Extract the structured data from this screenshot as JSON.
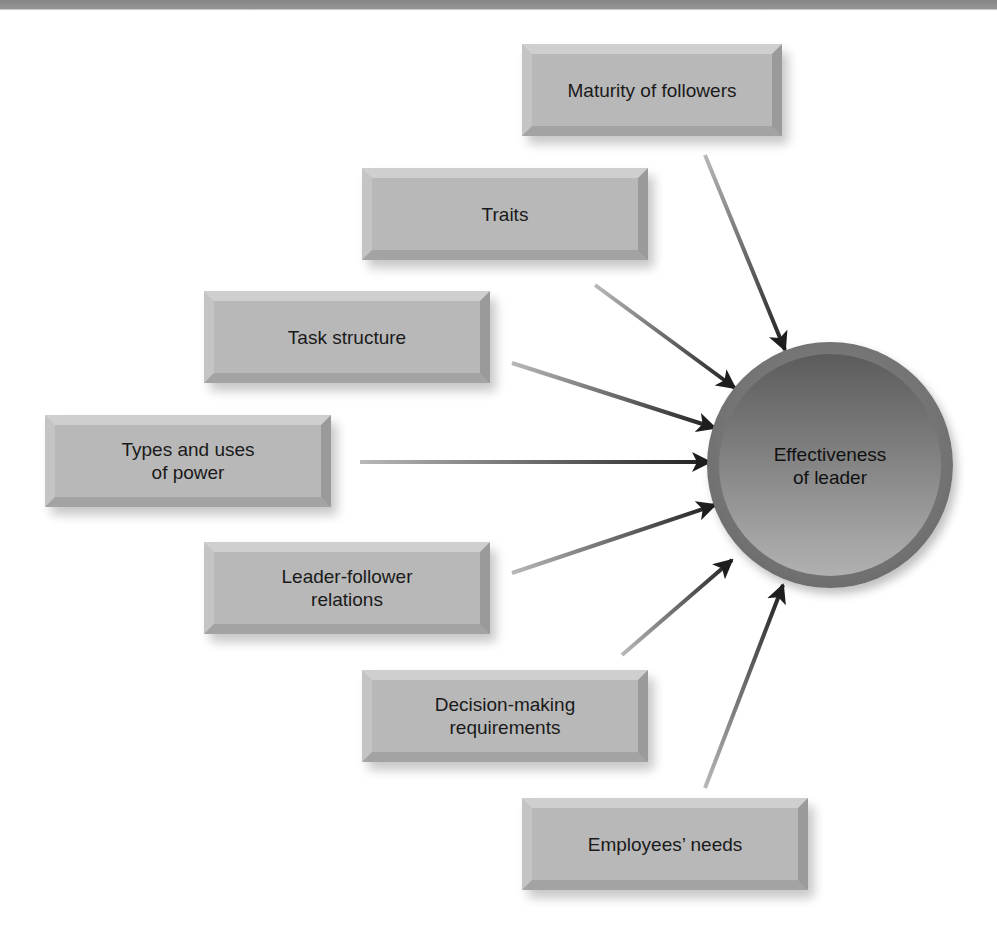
{
  "diagram": {
    "title": "",
    "center": {
      "label": "Effectiveness\nof leader",
      "color_outer": "#6e6e6e",
      "color_inner_top": "#5c5c5c",
      "color_inner_bottom": "#b0b0b0"
    },
    "factors": [
      {
        "id": "maturity",
        "label": "Maturity of followers"
      },
      {
        "id": "traits",
        "label": "Traits"
      },
      {
        "id": "task",
        "label": "Task structure"
      },
      {
        "id": "power",
        "label": "Types and uses\nof power"
      },
      {
        "id": "relations",
        "label": "Leader-follower\nrelations"
      },
      {
        "id": "decision",
        "label": "Decision-making\nrequirements"
      },
      {
        "id": "needs",
        "label": "Employees’ needs"
      }
    ],
    "edges": [
      {
        "from": "maturity",
        "to": "center"
      },
      {
        "from": "traits",
        "to": "center"
      },
      {
        "from": "task",
        "to": "center"
      },
      {
        "from": "power",
        "to": "center"
      },
      {
        "from": "relations",
        "to": "center"
      },
      {
        "from": "decision",
        "to": "center"
      },
      {
        "from": "needs",
        "to": "center"
      }
    ],
    "colors": {
      "box_face": "#b8b8b8",
      "arrow_tail": "#b5b5b5",
      "arrow_head": "#1e1e1e",
      "header_bar": "#8a8a8a"
    }
  }
}
